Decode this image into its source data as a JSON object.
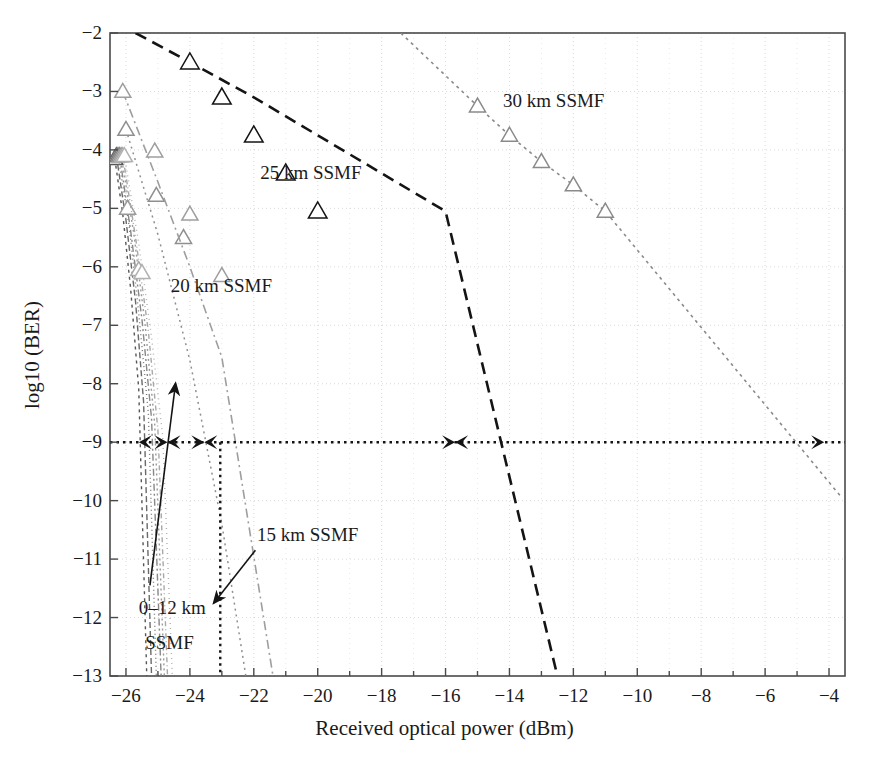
{
  "figure": {
    "background": "#ffffff",
    "plot_area": {
      "left": 110,
      "top": 33,
      "right": 845,
      "bottom": 676
    }
  },
  "chart_data": {
    "type": "line",
    "title": "",
    "xlabel": "Received optical power (dBm)",
    "ylabel": "log10 (BER)",
    "xlim": [
      -26.5,
      -3.5
    ],
    "ylim": [
      -13,
      -2
    ],
    "xticks": [
      -26,
      -25,
      -24,
      -23,
      -22,
      -21,
      -20,
      -19,
      -18,
      -17,
      -16,
      -15,
      -14,
      -13,
      -12,
      -11,
      -10,
      -9,
      -8,
      -7,
      -6,
      -5,
      -4
    ],
    "xtick_labels_major": [
      -26,
      -24,
      -22,
      -20,
      -18,
      -16,
      -14,
      -12,
      -10,
      -8,
      -6,
      -4
    ],
    "yticks": [
      -2,
      -3,
      -4,
      -5,
      -6,
      -7,
      -8,
      -9,
      -10,
      -11,
      -12,
      -13
    ],
    "grid": true,
    "grid_color": "#c9c9c9",
    "legend": "inline-annotations",
    "marker": "triangle-up-open",
    "series": [
      {
        "name": "0 km SSMF",
        "label_group": "0–12 km SSMF",
        "color": "#555555",
        "dash": "3,4",
        "width": 1.4,
        "x": [
          -26.35,
          -26.1,
          -25.85,
          -25.6,
          -25.35
        ],
        "y": [
          -4.15,
          -5.1,
          -6.4,
          -8.1,
          -13.0
        ],
        "markers_x": [
          -26.35
        ],
        "markers_y": [
          -4.15
        ],
        "ber9_crossing": -25.55
      },
      {
        "name": "2 km SSMF",
        "label_group": "0–12 km SSMF",
        "color": "#6a6a6a",
        "dash": "6,3",
        "width": 1.4,
        "x": [
          -26.3,
          -26.0,
          -25.7,
          -25.45,
          -25.2
        ],
        "y": [
          -4.1,
          -5.2,
          -6.6,
          -8.3,
          -13.0
        ],
        "markers_x": [
          -26.3
        ],
        "markers_y": [
          -4.1
        ],
        "ber9_crossing": -25.4
      },
      {
        "name": "4 km SSMF",
        "label_group": "0–12 km SSMF",
        "color": "#777777",
        "dash": "1,3",
        "width": 1.4,
        "x": [
          -26.25,
          -25.9,
          -25.6,
          -25.3,
          -25.05
        ],
        "y": [
          -4.1,
          -5.3,
          -6.8,
          -8.5,
          -13.0
        ],
        "markers_x": [
          -26.25
        ],
        "markers_y": [
          -4.1
        ],
        "ber9_crossing": -25.25
      },
      {
        "name": "6 km SSMF",
        "label_group": "0–12 km SSMF",
        "color": "#888888",
        "dash": "7,3,2,3",
        "width": 1.4,
        "x": [
          -26.2,
          -25.85,
          -25.5,
          -25.2,
          -24.9
        ],
        "y": [
          -4.1,
          -5.4,
          -6.9,
          -8.6,
          -13.0
        ],
        "markers_x": [
          -26.2
        ],
        "markers_y": [
          -4.1
        ],
        "ber9_crossing": -25.1
      },
      {
        "name": "8 km SSMF",
        "label_group": "0–12 km SSMF",
        "color": "#9a9a9a",
        "dash": "2,3",
        "width": 1.4,
        "x": [
          -26.15,
          -25.75,
          -25.4,
          -25.1,
          -24.8
        ],
        "y": [
          -4.1,
          -5.45,
          -7.0,
          -8.7,
          -13.0
        ],
        "markers_x": [
          -26.15,
          -25.95
        ],
        "markers_y": [
          -4.1,
          -5.0
        ],
        "ber9_crossing": -25.0
      },
      {
        "name": "10 km SSMF",
        "label_group": "0–12 km SSMF",
        "color": "#a8a8a8",
        "dash": "5,3,1,3",
        "width": 1.4,
        "x": [
          -26.1,
          -25.7,
          -25.3,
          -25.0,
          -24.7
        ],
        "y": [
          -4.1,
          -5.5,
          -7.1,
          -8.8,
          -13.0
        ],
        "markers_x": [
          -26.1,
          -25.6
        ],
        "markers_y": [
          -4.1,
          -6.05
        ],
        "ber9_crossing": -24.9
      },
      {
        "name": "12 km SSMF",
        "label_group": "0–12 km SSMF",
        "color": "#b2b2b2",
        "dash": "1,4",
        "width": 1.4,
        "x": [
          -26.05,
          -25.6,
          -25.2,
          -24.85,
          -24.55
        ],
        "y": [
          -4.1,
          -5.6,
          -7.2,
          -8.9,
          -13.0
        ],
        "markers_x": [
          -26.05,
          -25.5
        ],
        "markers_y": [
          -4.1,
          -6.1
        ],
        "ber9_crossing": -24.8
      },
      {
        "name": "15 km SSMF",
        "label_group": "15 km SSMF",
        "color": "#8f8f8f",
        "dash": "2,4",
        "width": 1.5,
        "x": [
          -26.0,
          -25.0,
          -24.0,
          -23.0,
          -22.25
        ],
        "y": [
          -3.65,
          -5.45,
          -7.6,
          -10.4,
          -13.0
        ],
        "markers_x": [
          -26.0,
          -25.05,
          -24.2
        ],
        "markers_y": [
          -3.65,
          -4.78,
          -5.5
        ],
        "ber9_crossing": -23.55
      },
      {
        "name": "20 km SSMF",
        "label_group": "20 km SSMF",
        "color": "#9e9e9e",
        "dash": "9,4,2,4",
        "width": 1.6,
        "x": [
          -26.1,
          -25.0,
          -24.0,
          -23.0,
          -21.4
        ],
        "y": [
          -3.0,
          -4.55,
          -6.0,
          -7.55,
          -13.0
        ],
        "markers_x": [
          -26.1,
          -25.1,
          -24.0,
          -23.0
        ],
        "markers_y": [
          -3.0,
          -4.02,
          -5.1,
          -6.15
        ],
        "ber9_crossing": -22.9
      },
      {
        "name": "25 km SSMF",
        "label_group": "25 km SSMF",
        "color": "#141414",
        "dash": "12,7",
        "width": 2.6,
        "x": [
          -25.7,
          -24.0,
          -22.0,
          -20.0,
          -18.0,
          -16.0,
          -12.5
        ],
        "y": [
          -2.0,
          -2.5,
          -3.1,
          -3.75,
          -4.4,
          -5.05,
          -13.0
        ],
        "markers_x": [
          -24.0,
          -23.0,
          -22.0,
          -21.0,
          -20.0
        ],
        "markers_y": [
          -2.5,
          -3.1,
          -3.75,
          -4.4,
          -5.05
        ],
        "ber9_crossing": -15.7
      },
      {
        "name": "30 km SSMF",
        "label_group": "30 km SSMF",
        "color": "#8a8a8a",
        "dash": "3,4",
        "width": 1.6,
        "x": [
          -17.4,
          -15.0,
          -14.0,
          -13.0,
          -12.0,
          -11.0,
          -3.6
        ],
        "y": [
          -2.0,
          -3.25,
          -3.75,
          -4.2,
          -4.6,
          -5.05,
          -9.95
        ],
        "markers_x": [
          -15.0,
          -14.0,
          -13.0,
          -12.0,
          -11.0
        ],
        "markers_y": [
          -3.25,
          -3.75,
          -4.2,
          -4.6,
          -5.05
        ],
        "ber9_crossing": -4.15
      }
    ],
    "annotations": [
      {
        "name": "label-25km",
        "text": "25 km SSMF",
        "x": -21.8,
        "y": -4.42
      },
      {
        "name": "label-30km",
        "text": "30 km SSMF",
        "x": -14.2,
        "y": -3.18
      },
      {
        "name": "label-20km",
        "text": "20 km SSMF",
        "x": -24.6,
        "y": -6.35
      },
      {
        "name": "label-15km",
        "text": "15 km SSMF",
        "x": -21.9,
        "y": -10.6
      },
      {
        "name": "label-0-12km-line1",
        "text": "0–12 km",
        "x": -25.6,
        "y": -11.85
      },
      {
        "name": "label-0-12km-line2",
        "text": "SSMF",
        "x": -25.4,
        "y": -12.45
      }
    ],
    "reference_line": {
      "name": "ber-1e-9-reference",
      "y": -9,
      "style": "dotted",
      "color": "#141414",
      "note": "BER = 1e-9 power penalty reference with double-headed span arrows"
    },
    "vertical_marker": {
      "name": "sensitivity-marker",
      "x": -23.05,
      "y_from": -9,
      "y_to": -13,
      "style": "dotted"
    },
    "span_arrows": [
      {
        "from": -25.6,
        "to": -24.7,
        "y": -9
      },
      {
        "from": -24.7,
        "to": -23.55,
        "y": -9
      },
      {
        "from": -23.55,
        "to": -15.7,
        "y": -9
      },
      {
        "from": -15.7,
        "to": -4.15,
        "y": -9
      }
    ],
    "pointer_arrows": [
      {
        "name": "arrow-15km",
        "from_x": -21.95,
        "from_y": -10.85,
        "to_x": -23.25,
        "to_y": -11.75
      },
      {
        "name": "arrow-0-12km",
        "from_x": -25.25,
        "from_y": -11.45,
        "to_x": -24.45,
        "to_y": -8.0
      }
    ]
  }
}
